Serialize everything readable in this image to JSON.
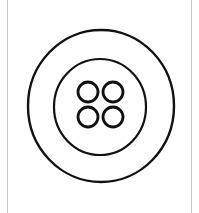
{
  "image": {
    "subject": "button",
    "description": "Line drawing of a four-hole clothing button",
    "colors": {
      "stroke": "#111111",
      "background": "#ffffff",
      "frame": "#c8c8c8"
    },
    "button": {
      "outer_ring": {
        "cx": 101,
        "cy": 106,
        "rx": 73,
        "ry": 76
      },
      "inner_ring": {
        "cx": 100,
        "cy": 107,
        "rx": 46,
        "ry": 48
      },
      "holes": [
        {
          "cx": 88,
          "cy": 92,
          "r": 10
        },
        {
          "cx": 113,
          "cy": 92,
          "r": 10
        },
        {
          "cx": 88,
          "cy": 117,
          "r": 10
        },
        {
          "cx": 113,
          "cy": 117,
          "r": 10
        }
      ],
      "hole_count": 4
    }
  }
}
